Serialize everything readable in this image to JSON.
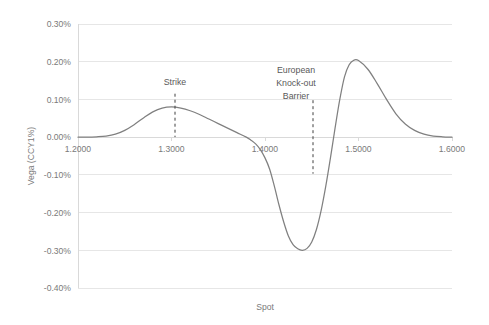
{
  "chart_data": {
    "type": "line",
    "title": "",
    "xlabel": "Spot",
    "ylabel": "Vega (CCY1%)",
    "xlim": [
      1.2,
      1.6
    ],
    "ylim": [
      -0.4,
      0.3
    ],
    "grid": true,
    "legend": "none",
    "x_tick_labels": [
      "1.2000",
      "1.3000",
      "1.4000",
      "1.5000",
      "1.6000"
    ],
    "x_ticks": [
      1.2,
      1.3,
      1.4,
      1.5,
      1.6
    ],
    "y_tick_labels": [
      "0.30%",
      "0.20%",
      "0.10%",
      "0.00%",
      "-0.10%",
      "-0.20%",
      "-0.30%",
      "-0.40%"
    ],
    "y_ticks": [
      0.3,
      0.2,
      0.1,
      0.0,
      -0.1,
      -0.2,
      -0.3,
      -0.4
    ],
    "series": [
      {
        "name": "Vega",
        "color": "#808080",
        "x": [
          1.2,
          1.21,
          1.22,
          1.23,
          1.24,
          1.25,
          1.26,
          1.27,
          1.28,
          1.29,
          1.3,
          1.31,
          1.32,
          1.33,
          1.34,
          1.35,
          1.36,
          1.37,
          1.38,
          1.385,
          1.39,
          1.395,
          1.4,
          1.405,
          1.41,
          1.415,
          1.42,
          1.425,
          1.43,
          1.435,
          1.44,
          1.445,
          1.45,
          1.455,
          1.46,
          1.465,
          1.47,
          1.475,
          1.48,
          1.485,
          1.49,
          1.495,
          1.5,
          1.51,
          1.52,
          1.53,
          1.54,
          1.55,
          1.56,
          1.57,
          1.58,
          1.59,
          1.6
        ],
        "y": [
          0.0,
          0.0,
          0.001,
          0.003,
          0.008,
          0.018,
          0.033,
          0.051,
          0.067,
          0.077,
          0.08,
          0.077,
          0.07,
          0.06,
          0.048,
          0.036,
          0.024,
          0.012,
          0.0,
          -0.008,
          -0.018,
          -0.033,
          -0.055,
          -0.085,
          -0.13,
          -0.18,
          -0.225,
          -0.262,
          -0.285,
          -0.296,
          -0.3,
          -0.295,
          -0.278,
          -0.245,
          -0.195,
          -0.13,
          -0.055,
          0.025,
          0.1,
          0.16,
          0.192,
          0.204,
          0.203,
          0.18,
          0.142,
          0.1,
          0.062,
          0.035,
          0.018,
          0.008,
          0.003,
          0.001,
          0.0
        ]
      }
    ],
    "annotations": [
      {
        "name": "strike",
        "lines": [
          "Strike"
        ],
        "x": 1.3035,
        "label_top_y": 0.145,
        "line_from_y": 0.115,
        "line_to_y": 0.0
      },
      {
        "name": "european-knock-out-barrier",
        "lines": [
          "European",
          "Knock-out",
          "Barrier"
        ],
        "x": 1.4513,
        "label_top_y": 0.255,
        "line_from_y": 0.098,
        "line_to_y": -0.097
      }
    ]
  }
}
